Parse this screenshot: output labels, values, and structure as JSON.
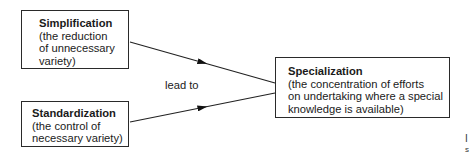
{
  "diagram": {
    "nodes": [
      {
        "id": "simplification",
        "title": "Simplification",
        "description": "(the reduction\nof unnecessary\nvariety)"
      },
      {
        "id": "standardization",
        "title": "Standardization",
        "description": "(the control of\nnecessary variety)"
      },
      {
        "id": "specialization",
        "title": "Specialization",
        "description": "(the concentration of efforts\non undertaking where a special\nknowledge is available)"
      }
    ],
    "edges": [
      {
        "from": "simplification",
        "to": "specialization"
      },
      {
        "from": "standardization",
        "to": "specialization"
      }
    ],
    "edge_label": "lead to",
    "cropped_edge_text": [
      "I",
      "s"
    ]
  }
}
